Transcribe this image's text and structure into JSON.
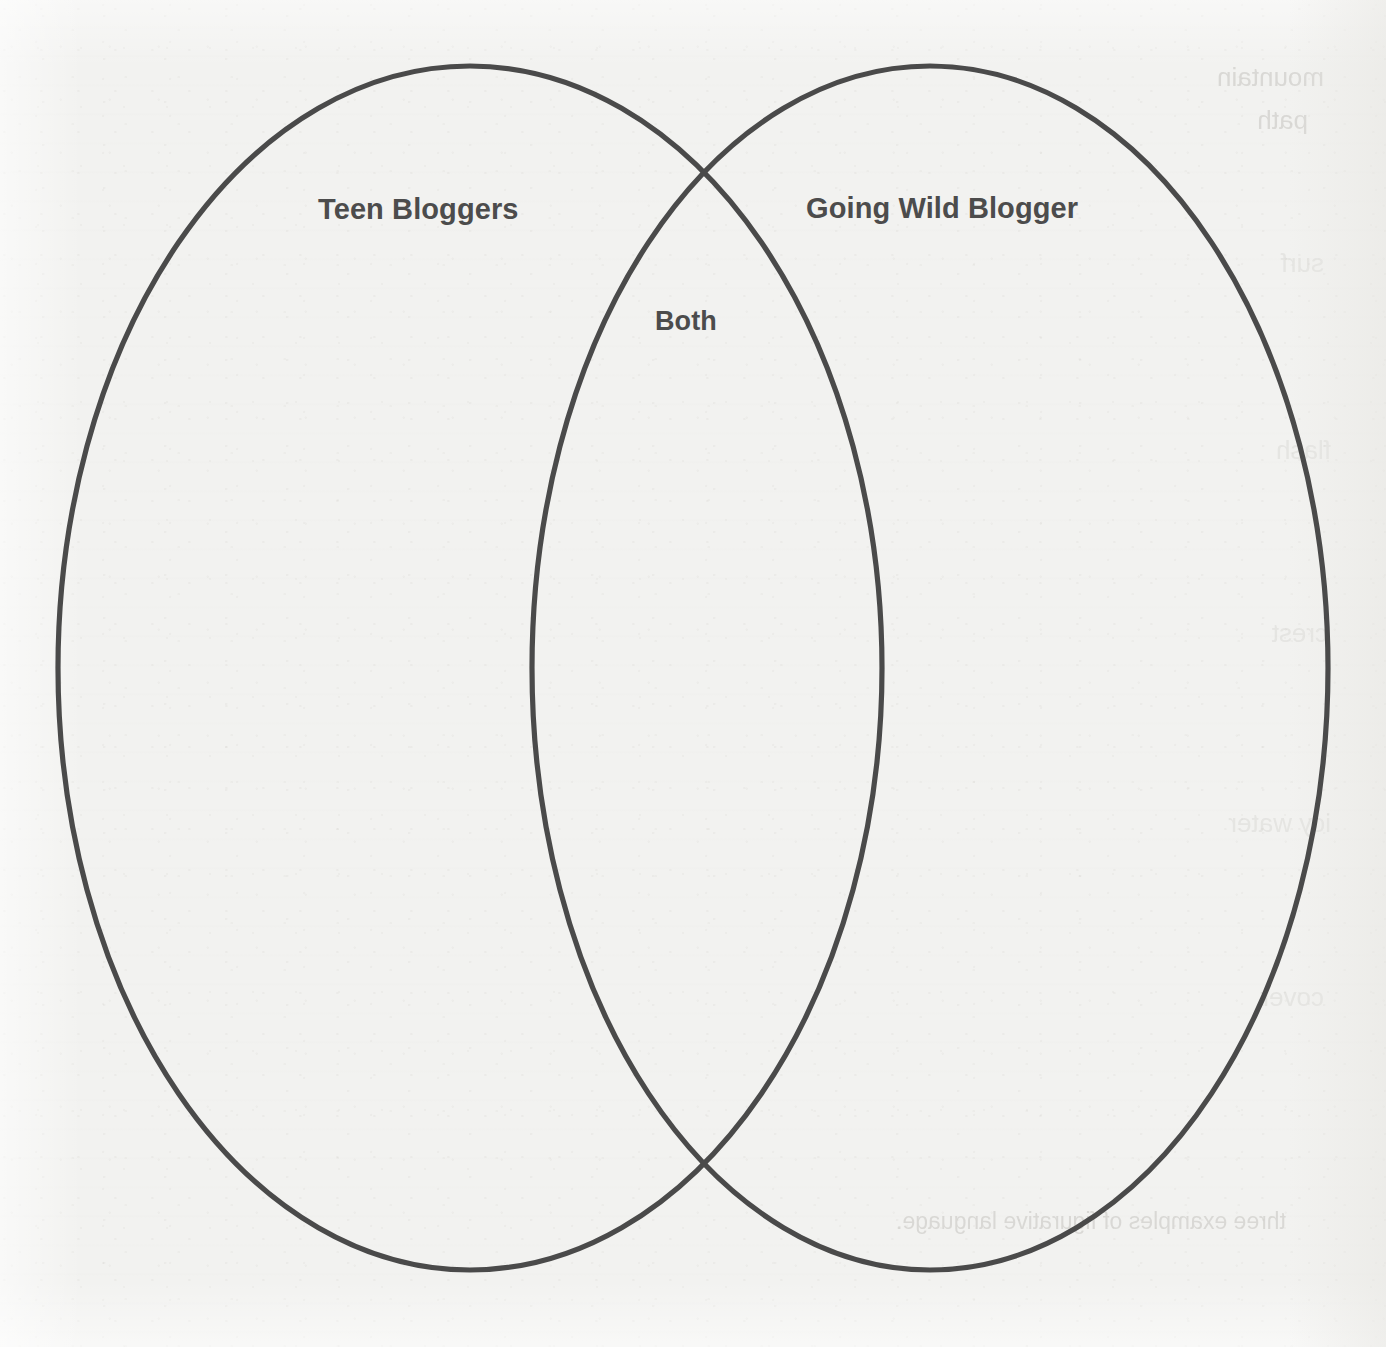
{
  "worksheet": {
    "type": "venn-diagram",
    "background_color": "#f2f2f0",
    "stroke_color": "#4a4a4a",
    "text_color": "#4c4c4c"
  },
  "diagram": {
    "left_circle": {
      "label": "Teen Bloggers",
      "cx": 470,
      "cy": 668,
      "rx": 412,
      "ry": 602
    },
    "right_circle": {
      "label": "Going Wild Blogger",
      "cx": 930,
      "cy": 668,
      "rx": 398,
      "ry": 602
    },
    "overlap": {
      "label": "Both"
    }
  },
  "bleed_through": {
    "note": "faint mirrored show-through text from the reverse side of the page",
    "items": [
      {
        "text": "mountain"
      },
      {
        "text": "path"
      },
      {
        "text": "surf"
      },
      {
        "text": "flash"
      },
      {
        "text": "crest"
      },
      {
        "text": "icy water"
      },
      {
        "text": "cover"
      },
      {
        "text": "three examples of figurative language."
      }
    ]
  }
}
